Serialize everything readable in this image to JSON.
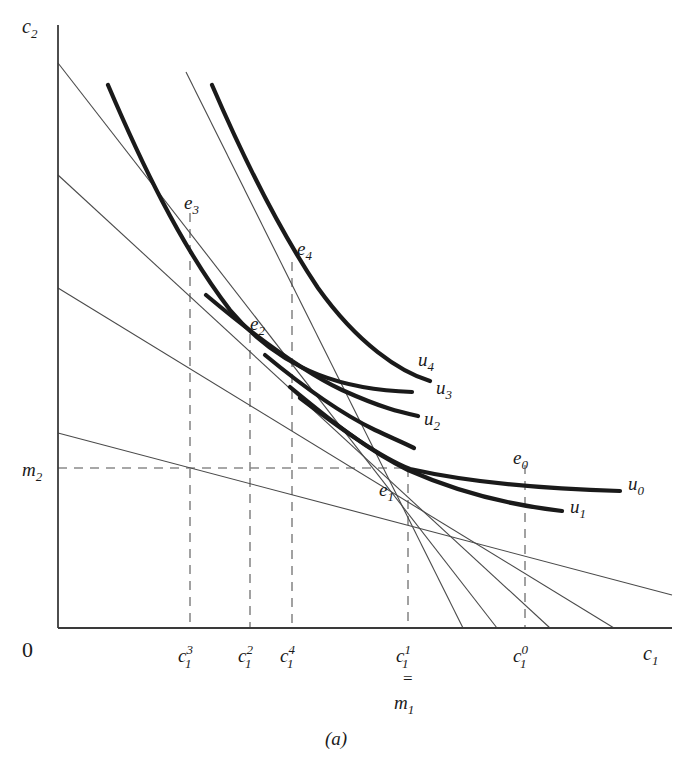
{
  "figure": {
    "caption": "(a)",
    "axes": {
      "y_label": "c",
      "y_label_sub": "2",
      "x_label": "c",
      "x_label_sub": "1",
      "origin_label": "0",
      "x_axis": {
        "x0": 58,
        "x1": 672,
        "y": 628
      },
      "y_axis": {
        "x": 58,
        "y0": 25,
        "y1": 628
      }
    },
    "endowment": {
      "x": 408,
      "y": 468,
      "label": "e",
      "label_sub": "1",
      "m1_label": "m",
      "m1_sub": "1",
      "m2_label": "m",
      "m2_sub": "2",
      "equals_sign": "="
    },
    "y_ticks": [
      {
        "name": "m2",
        "base": "m",
        "sub": "2",
        "y": 468,
        "x_label": 24
      }
    ],
    "x_ticks": [
      {
        "name": "c1_3",
        "base": "c",
        "sub": "1",
        "sup": "3",
        "x": 190
      },
      {
        "name": "c1_2",
        "base": "c",
        "sub": "1",
        "sup": "2",
        "x": 250
      },
      {
        "name": "c1_4",
        "base": "c",
        "sub": "1",
        "sup": "4",
        "x": 292
      },
      {
        "name": "c1_1",
        "base": "c",
        "sub": "1",
        "sup": "1",
        "x": 408
      },
      {
        "name": "c1_0",
        "base": "c",
        "sub": "1",
        "sup": "0",
        "x": 525
      }
    ],
    "equilibria": [
      {
        "name": "e0",
        "base": "e",
        "sub": "0",
        "x": 525,
        "y": 465,
        "lx": 515,
        "ly": 455,
        "dashed_to_axis": true
      },
      {
        "name": "e1",
        "base": "e",
        "sub": "1",
        "x": 408,
        "y": 468,
        "lx": 382,
        "ly": 492,
        "dashed_to_axis": true
      },
      {
        "name": "e2",
        "base": "e",
        "sub": "2",
        "x": 250,
        "y": 334,
        "lx": 252,
        "ly": 328,
        "dashed_to_axis": true
      },
      {
        "name": "e3",
        "base": "e",
        "sub": "3",
        "x": 190,
        "y": 213,
        "lx": 186,
        "ly": 205,
        "dashed_to_axis": true
      },
      {
        "name": "e4",
        "base": "e",
        "sub": "4",
        "x": 292,
        "y": 262,
        "lx": 297,
        "ly": 251,
        "dashed_to_axis": true
      }
    ],
    "indifference_curves": [
      {
        "name": "u0",
        "base": "u",
        "sub": "0",
        "label_x": 628,
        "label_y": 483,
        "path": "M 408,468 C 470,477 540,487 620,492"
      },
      {
        "name": "u1",
        "base": "u",
        "sub": "1",
        "label_x": 572,
        "label_y": 507,
        "path": "M 290,387 C 330,420 370,452 408,470 C 462,494 518,506 562,511"
      },
      {
        "name": "u2",
        "base": "u",
        "sub": "2",
        "label_x": 420,
        "label_y": 424,
        "path": "M 265,355 C 300,383 340,412 372,428 C 390,437 400,441 412,447"
      },
      {
        "name": "u3",
        "base": "u",
        "sub": "3",
        "label_x": 432,
        "label_y": 394,
        "path": "M 206,295 C 250,330 300,368 340,388 C 380,406 400,410 418,414"
      },
      {
        "name": "u4",
        "base": "u",
        "sub": "4",
        "label_x": 420,
        "label_y": 364,
        "path": "M 157,268 C 200,305 250,341 300,365 C 345,385 382,389 406,390"
      }
    ],
    "indifference_curves_upper": [
      {
        "name": "u3-upper",
        "path": "M 212,85 C 240,150 280,230 320,290 C 360,345 400,372 432,383"
      },
      {
        "name": "u4-upper",
        "path": "M 108,85 C 140,160 180,245 230,310 C 285,375 350,398 408,405"
      }
    ],
    "budget_lines": [
      {
        "name": "budget-0",
        "x1": 58,
        "y1": 433,
        "x2": 672,
        "y2": 595
      },
      {
        "name": "budget-1",
        "x1": 58,
        "y1": 288,
        "x2": 614,
        "y2": 628
      },
      {
        "name": "budget-2",
        "x1": 58,
        "y1": 175,
        "x2": 550,
        "y2": 628
      },
      {
        "name": "budget-3",
        "x1": 58,
        "y1": 63,
        "x2": 497,
        "y2": 628
      },
      {
        "name": "budget-4",
        "x1": 186,
        "y1": 72,
        "x2": 463,
        "y2": 628
      }
    ],
    "colors": {
      "axis": "#3a3a3a",
      "budget": "#4a4a4a",
      "indifference": "#1a1a1a",
      "dashed": "#8a8a8a",
      "background": "#ffffff"
    }
  }
}
